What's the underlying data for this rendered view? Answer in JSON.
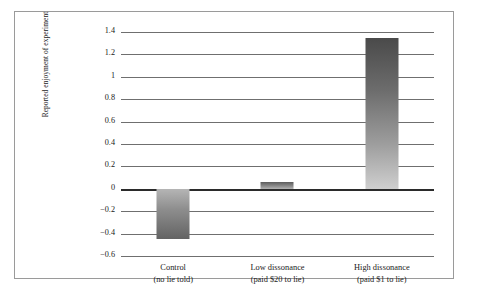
{
  "chart_data": {
    "type": "bar",
    "title": "",
    "subtitle": "",
    "xlabel": "",
    "ylabel": "Reported enjoyment of experiment",
    "ylim": [
      -0.6,
      1.4
    ],
    "yticks": [
      "1.4",
      "1.2",
      "1",
      "0.8",
      "0.6",
      "0.4",
      "0.2",
      "0",
      "−0.2",
      "−0.4",
      "−0.6"
    ],
    "ytick_values": [
      1.4,
      1.2,
      1.0,
      0.8,
      0.6,
      0.4,
      0.2,
      0,
      -0.2,
      -0.4,
      -0.6
    ],
    "grid": true,
    "legend": "none",
    "categories": [
      {
        "line1": "Control",
        "line2": "(no lie told)"
      },
      {
        "line1": "Low dissonance",
        "line2": "(paid $20 to lie)"
      },
      {
        "line1": "High dissonance",
        "line2": "(paid $1 to lie)"
      }
    ],
    "category_labels": [
      "Control (no lie told)",
      "Low dissonance (paid $20 to lie)",
      "High dissonance (paid $1 to lie)"
    ],
    "values": [
      -0.45,
      0.06,
      1.35
    ],
    "bar_colors": {
      "gradient_top": "#4a4a4a",
      "gradient_bottom": "#cfcfcf"
    },
    "axis_colors": {
      "gridline": "#6f6f6f",
      "zero_line": "#2b2b2b",
      "frame": "#9a9a9a",
      "text": "#1a1a1a",
      "background": "#ffffff"
    }
  }
}
